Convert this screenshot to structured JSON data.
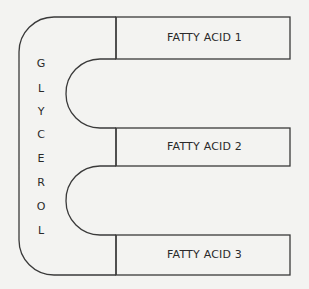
{
  "diagram": {
    "type": "triglyceride structure",
    "backbone": {
      "label": "GLYCEROL",
      "letters": [
        "G",
        "L",
        "Y",
        "C",
        "E",
        "R",
        "O",
        "L"
      ]
    },
    "fatty_acids": [
      {
        "label": "FATTY ACID 1"
      },
      {
        "label": "FATTY ACID 2"
      },
      {
        "label": "FATTY ACID 3"
      }
    ],
    "colors": {
      "line": "#3a3a3a",
      "background": "#f3f3f1",
      "text": "#2a2a2a"
    }
  }
}
